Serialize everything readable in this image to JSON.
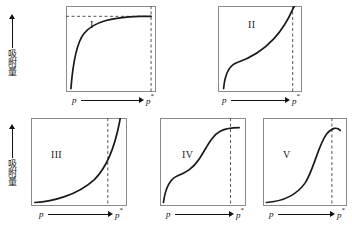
{
  "figure": {
    "background": "#ffffff",
    "curve_color": "#1a1a1a",
    "frame_color": "#8a8a8a",
    "dash_color": "#555555",
    "axis": {
      "x_start_label": "p",
      "x_end_label": "p",
      "x_end_superscript": "*",
      "y_label": "吸附量"
    },
    "panels": [
      {
        "id": "panel-1",
        "roman": "I",
        "description": "Type I isotherm: steep initial rise then horizontal plateau (Langmuir-type monolayer), horizontal dashed asymptote plus vertical dashed line at p*",
        "has_horizontal_asymptote": true,
        "has_vertical_dashed": true,
        "curve": "M 6 96 C 8 72, 12 44, 22 32 C 34 18, 56 13, 90 12 L 104 12"
      },
      {
        "id": "panel-2",
        "roman": "II",
        "description": "Type II isotherm: concave knee at low p, near-linear midsection, sharp upswing approaching p*",
        "has_horizontal_asymptote": false,
        "has_vertical_dashed": true,
        "curve": "M 6 96 C 7 84, 10 70, 20 66 C 34 61, 48 52, 60 38 C 70 26, 76 14, 80 4 L 82 0"
      },
      {
        "id": "panel-3",
        "roman": "III",
        "description": "Type III isotherm: convex to the p axis throughout, no knee, accelerating rise toward p*",
        "has_horizontal_asymptote": false,
        "has_vertical_dashed": true,
        "curve": "M 4 96 C 22 95, 48 88, 66 70 C 80 55, 88 28, 92 6 L 93 0"
      },
      {
        "id": "panel-4",
        "roman": "IV",
        "description": "Type IV isotherm: knee at low p, sigmoidal central rise, saturation plateau before p*",
        "has_horizontal_asymptote": false,
        "has_vertical_dashed": true,
        "curve": "M 4 96 C 6 82, 10 70, 20 66 C 30 62, 38 58, 46 46 C 54 34, 60 20, 70 15 C 78 11, 86 11, 92 11"
      },
      {
        "id": "panel-5",
        "roman": "V",
        "description": "Type V isotherm: flat uptake at low p, steep sigmoidal rise, slight downturn near p*",
        "has_horizontal_asymptote": false,
        "has_vertical_dashed": true,
        "curve": "M 4 96 C 20 95, 38 90, 50 74 C 60 60, 66 30, 76 18 C 82 11, 88 10, 92 14"
      }
    ]
  }
}
